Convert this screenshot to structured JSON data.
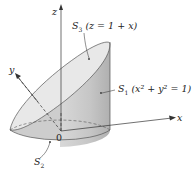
{
  "diagram": {
    "type": "3d-solid-surface-figure",
    "axes": {
      "z_label": "z",
      "y_label": "y",
      "x_label": "x",
      "origin_label": "0"
    },
    "surfaces": [
      {
        "id": "S3",
        "name": "S",
        "subscript": "3",
        "equation": "(z = 1 + x)",
        "description": "slanted top plane (elliptical cap)"
      },
      {
        "id": "S1",
        "name": "S",
        "subscript": "1",
        "equation": "(x² + y² = 1)",
        "description": "cylinder side surface"
      },
      {
        "id": "S2",
        "name": "S",
        "subscript": "2",
        "equation": "",
        "description": "bottom disk"
      }
    ],
    "colors": {
      "cap_fill": "#e6e6e6",
      "side_fill": "#c4c4c4",
      "side_shadow": "#b3b3b3",
      "bottom_fill": "#cfcfcf",
      "stroke": "#444444",
      "axis": "#333333"
    }
  }
}
